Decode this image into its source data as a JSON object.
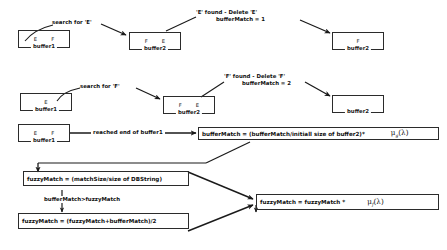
{
  "diagram": {
    "type": "flowchart",
    "stroke_color": "#2b2b2b",
    "text_color": "#1a1a1a",
    "background": "#ffffff",
    "rows": [
      {
        "id": "row-1",
        "boxes": [
          {
            "id": "r1-buffer1",
            "cells": [
              "E",
              "F"
            ],
            "caption": "buffer1"
          },
          {
            "id": "r1-buffer2-before",
            "cells": [
              "F",
              "E"
            ],
            "caption": "buffer2"
          },
          {
            "id": "r1-buffer2-after",
            "cells": [
              "F"
            ],
            "caption": "buffer2"
          }
        ],
        "labels": [
          {
            "id": "r1-search",
            "text": "search for 'E'"
          },
          {
            "id": "r1-found-line1",
            "text": "'E' found  -  Delete 'E'"
          },
          {
            "id": "r1-found-line2",
            "text": "bufferMatch =  1"
          }
        ]
      },
      {
        "id": "row-2",
        "boxes": [
          {
            "id": "r2-buffer1",
            "cells": [
              "E"
            ],
            "caption": "buffer1"
          },
          {
            "id": "r2-buffer2-before",
            "cells": [
              "F",
              "E"
            ],
            "caption": "buffer2"
          },
          {
            "id": "r2-buffer2-after",
            "cells": [],
            "caption": "buffer2"
          }
        ],
        "labels": [
          {
            "id": "r2-search",
            "text": "search for 'F'"
          },
          {
            "id": "r2-found-line1",
            "text": "'F' found  -  Delete 'F'"
          },
          {
            "id": "r2-found-line2",
            "text": "bufferMatch = 2"
          }
        ]
      },
      {
        "id": "row-3",
        "boxes": [
          {
            "id": "r3-buffer1",
            "cells": [
              "E",
              "F"
            ],
            "caption": "buffer1"
          }
        ],
        "labels": [
          {
            "id": "r3-reached",
            "text": "reached end of buffer1"
          }
        ]
      }
    ],
    "formulas": {
      "buffer_match": {
        "id": "formula-buffermatch",
        "text": "bufferMatch = (bufferMatch/initiall  size of buffer2)*",
        "mu_symbol": "μ",
        "mu_subscript": "g",
        "mu_arg": "(λ)"
      },
      "fuzzy_match_init": {
        "id": "formula-fuzzymatch-init",
        "text": "fuzzyMatch = (matchSize/size of DBString)"
      },
      "fuzzy_match_avg": {
        "id": "formula-fuzzymatch-avg",
        "text": "fuzzyMatch = (fuzzyMatch+bufferMatch)/2"
      },
      "fuzzy_match_final": {
        "id": "formula-fuzzymatch-final",
        "text": "fuzzyMatch =   fuzzyMatch *",
        "mu_symbol": "μ",
        "mu_subscript": "f",
        "mu_arg": "(λ)"
      }
    },
    "conditions": {
      "buffer_gt_fuzzy": "bufferMatch>fuzzyMatch"
    }
  }
}
